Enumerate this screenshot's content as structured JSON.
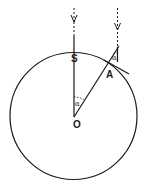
{
  "diagram": {
    "labels": {
      "S": "S",
      "A": "A",
      "O": "O",
      "alpha_at_O": "α",
      "alpha_at_A": "α"
    },
    "colors": {
      "stroke": "#1a1a1a",
      "background": "#ffffff"
    },
    "elements": [
      "circle centered at O",
      "vertical ray arrow from above through S to O",
      "vertical ray arrow from above reaching A",
      "radius line from O through A",
      "tangent line at A",
      "angle alpha at O between OS and OA",
      "angle alpha at A between vertical ray and radius"
    ]
  }
}
